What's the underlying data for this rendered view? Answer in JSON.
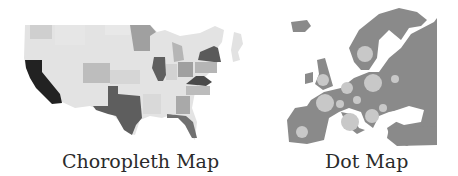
{
  "figure": {
    "panels": [
      {
        "id": "choropleth",
        "caption": "Choropleth Map",
        "region": "United States",
        "map_type": "choropleth",
        "colors": {
          "very_light": "#e3e3e3",
          "light": "#d0d0d0",
          "medium": "#a9a9a9",
          "dark": "#6d6d6d",
          "darkest": "#222222"
        },
        "highlighted_states": {
          "darkest": [
            "California"
          ],
          "dark": [
            "Texas",
            "Illinois",
            "New York",
            "Virginia",
            "Florida"
          ],
          "medium": [
            "Minnesota",
            "Ohio",
            "Michigan",
            "Georgia",
            "North Carolina",
            "Pennsylvania",
            "Colorado"
          ]
        }
      },
      {
        "id": "dot",
        "caption": "Dot Map",
        "region": "Europe",
        "map_type": "dot",
        "colors": {
          "land": "#8a8a8a",
          "dots": "#c8c8c8",
          "faded_land": "#e2e2e2"
        },
        "dot_count": 15
      }
    ]
  }
}
